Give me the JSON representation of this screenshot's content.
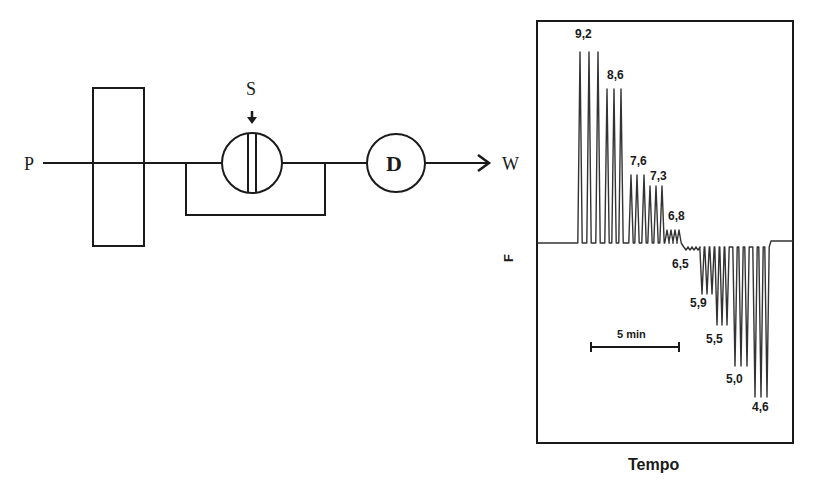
{
  "schematic": {
    "pump_label": "P",
    "injector_label": "S",
    "detector_label": "D",
    "waste_label": "W"
  },
  "chart": {
    "y_axis_label": "F",
    "x_axis_label": "Tempo",
    "scale_bar_label": "5 min"
  },
  "chart_data": {
    "type": "line",
    "title": "",
    "xlabel": "Tempo",
    "ylabel": "F",
    "grid": false,
    "legend": null,
    "scale_bar": "5 min",
    "groups": [
      {
        "label": "9,2",
        "direction": "up",
        "peaks": [
          {
            "x": 580,
            "top": 52
          },
          {
            "x": 589,
            "top": 52
          },
          {
            "x": 598,
            "top": 52
          }
        ],
        "label_pos": [
          575,
          38
        ]
      },
      {
        "label": "8,6",
        "direction": "up",
        "peaks": [
          {
            "x": 607,
            "top": 89
          },
          {
            "x": 614,
            "top": 89
          },
          {
            "x": 621,
            "top": 89
          }
        ],
        "label_pos": [
          607,
          79
        ]
      },
      {
        "label": "7,6",
        "direction": "up",
        "peaks": [
          {
            "x": 631,
            "top": 175
          },
          {
            "x": 637,
            "top": 175
          },
          {
            "x": 644,
            "top": 175
          }
        ],
        "label_pos": [
          630,
          165
        ]
      },
      {
        "label": "7,3",
        "direction": "up",
        "peaks": [
          {
            "x": 650,
            "top": 186
          },
          {
            "x": 656,
            "top": 186
          },
          {
            "x": 662,
            "top": 186
          }
        ],
        "label_pos": [
          650,
          180
        ]
      },
      {
        "label": "6,8",
        "direction": "up",
        "peaks": [
          {
            "x": 667,
            "top": 230
          },
          {
            "x": 671,
            "top": 230
          },
          {
            "x": 675,
            "top": 230
          },
          {
            "x": 679,
            "top": 230
          }
        ],
        "label_pos": [
          668,
          220
        ]
      },
      {
        "label": "6,5",
        "direction": "down",
        "peaks": [
          {
            "x": 686,
            "bottom": 250
          },
          {
            "x": 690,
            "bottom": 250
          },
          {
            "x": 694,
            "bottom": 250
          },
          {
            "x": 698,
            "bottom": 250
          }
        ],
        "label_pos": [
          672,
          268
        ]
      },
      {
        "label": "5,9",
        "direction": "down",
        "peaks": [
          {
            "x": 702,
            "bottom": 294
          },
          {
            "x": 707,
            "bottom": 294
          },
          {
            "x": 712,
            "bottom": 294
          }
        ],
        "label_pos": [
          690,
          307
        ]
      },
      {
        "label": "5,5",
        "direction": "down",
        "peaks": [
          {
            "x": 717,
            "bottom": 325
          },
          {
            "x": 722,
            "bottom": 325
          },
          {
            "x": 727,
            "bottom": 325
          }
        ],
        "label_pos": [
          706,
          343
        ]
      },
      {
        "label": "5,0",
        "direction": "down",
        "peaks": [
          {
            "x": 735,
            "bottom": 366
          },
          {
            "x": 741,
            "bottom": 366
          },
          {
            "x": 747,
            "bottom": 366
          }
        ],
        "label_pos": [
          726,
          383
        ]
      },
      {
        "label": "4,6",
        "direction": "down",
        "peaks": [
          {
            "x": 755,
            "bottom": 397
          },
          {
            "x": 761,
            "bottom": 397
          },
          {
            "x": 767,
            "bottom": 397
          }
        ],
        "label_pos": [
          752,
          411
        ]
      }
    ],
    "peak_labels": [
      "9,2",
      "8,6",
      "7,6",
      "7,3",
      "6,8",
      "6,5",
      "5,9",
      "5,5",
      "5,0",
      "4,6"
    ]
  },
  "colors": {
    "line": "#1a1a1a",
    "trace": "#333333",
    "background": "#ffffff"
  }
}
